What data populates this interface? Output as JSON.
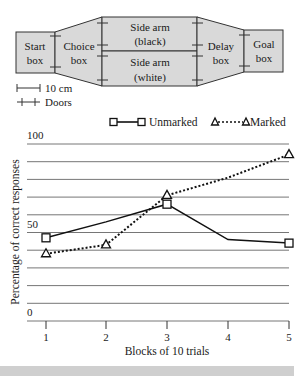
{
  "diagram": {
    "start_box": [
      "Start",
      "box"
    ],
    "choice_box": [
      "Choice",
      "box"
    ],
    "side_arm_black": [
      "Side arm",
      "(black)"
    ],
    "side_arm_white": [
      "Side arm",
      "(white)"
    ],
    "delay_box": [
      "Delay",
      "box"
    ],
    "goal_box": [
      "Goal",
      "box"
    ],
    "scale_label": "10 cm",
    "doors_label": "Doors",
    "fill_color": "#d9d9d9",
    "stroke_color": "#333333"
  },
  "legend": {
    "unmarked": "Unmarked",
    "marked": "Marked"
  },
  "axes": {
    "ylabel": "Percentage of correct responses",
    "xlabel": "Blocks of 10 trials",
    "y_ticks": [
      "100",
      "50",
      "0"
    ],
    "x_ticks": [
      "1",
      "2",
      "3",
      "4",
      "5"
    ]
  },
  "chart_data": {
    "type": "line",
    "title": "",
    "xlabel": "Blocks of 10 trials",
    "ylabel": "Percentage of correct responses",
    "categories": [
      1,
      2,
      3,
      4,
      5
    ],
    "series": [
      {
        "name": "Unmarked",
        "style": "solid",
        "marker": "square",
        "values": [
          47,
          56,
          66,
          46,
          44
        ]
      },
      {
        "name": "Marked",
        "style": "dotted",
        "marker": "triangle",
        "values": [
          38,
          43,
          71,
          81,
          94
        ]
      }
    ],
    "ylim": [
      0,
      100
    ],
    "y_tick_labels": [
      0,
      50,
      100
    ],
    "grid": "horizontal lines every 10",
    "legend_position": "top"
  }
}
